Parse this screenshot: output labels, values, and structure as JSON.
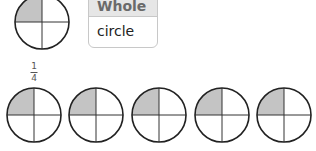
{
  "table": {
    "header": "Whole",
    "cell": "circle"
  },
  "fraction_label": {
    "numerator": "1",
    "denominator": "4"
  },
  "colors": {
    "shaded": "#c4c4c4",
    "stroke": "#222222"
  },
  "whole_circle": {
    "cx": 42,
    "cy": 22,
    "r": 27,
    "shaded_quadrant": "top-left"
  },
  "quarter_circles": [
    {
      "cx": 34,
      "cy": 115,
      "r": 27,
      "shaded_quadrant": "top-left"
    },
    {
      "cx": 96,
      "cy": 115,
      "r": 27,
      "shaded_quadrant": "top-left"
    },
    {
      "cx": 159,
      "cy": 115,
      "r": 27,
      "shaded_quadrant": "top-left"
    },
    {
      "cx": 222,
      "cy": 115,
      "r": 27,
      "shaded_quadrant": "top-left"
    },
    {
      "cx": 284,
      "cy": 115,
      "r": 27,
      "shaded_quadrant": "top-left"
    }
  ]
}
